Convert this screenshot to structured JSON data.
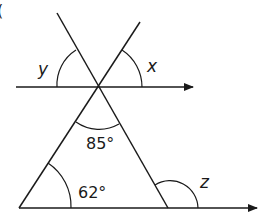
{
  "diagram": {
    "question_marker": "(",
    "angles": {
      "y": {
        "label": "y"
      },
      "x": {
        "label": "x"
      },
      "apex": {
        "label": "85°"
      },
      "base_left": {
        "label": "62°"
      },
      "z": {
        "label": "z"
      }
    },
    "colors": {
      "ink": "#1a1a1a",
      "background": "#ffffff"
    }
  }
}
